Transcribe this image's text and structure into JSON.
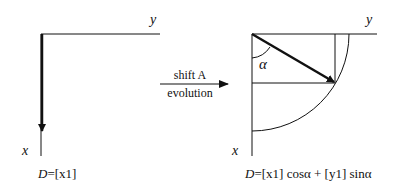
{
  "left_panel": {
    "y_axis_label": "y",
    "x_axis_label": "x",
    "formula_D": "D",
    "formula_rest": "=[x1]"
  },
  "transition": {
    "top_label": "shift A",
    "bottom_label": "evolution"
  },
  "right_panel": {
    "y_axis_label": "y",
    "x_axis_label": "x",
    "angle_label": "α",
    "formula_D": "D",
    "formula_rest": "=[x1] cosα + [y1] sinα"
  },
  "colors": {
    "line": "#111111",
    "background": "#ffffff"
  }
}
